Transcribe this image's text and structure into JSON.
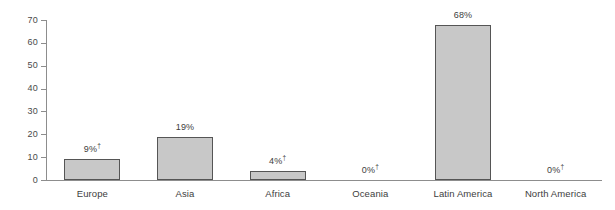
{
  "chart_data": {
    "type": "bar",
    "title": "",
    "subtitle": "",
    "xlabel": "",
    "ylabel": "",
    "ylim": [
      0,
      70
    ],
    "ytick_labels": [
      "70",
      "60",
      "50",
      "40",
      "30",
      "20",
      "10",
      "0"
    ],
    "ytick_values": [
      70,
      60,
      50,
      40,
      30,
      20,
      10,
      0
    ],
    "grid": false,
    "legend": null,
    "categories": [
      "Europe",
      "Asia",
      "Africa",
      "Oceania",
      "Latin America",
      "North America"
    ],
    "values": [
      9,
      19,
      4,
      0,
      68,
      0
    ],
    "data_labels": [
      "9%",
      "19%",
      "4%",
      "0%",
      "68%",
      "0%"
    ],
    "footnote_markers": [
      "†",
      "",
      "†",
      "†",
      "",
      "†"
    ],
    "colors": {
      "bar_fill": "#c8c8c8",
      "bar_border": "#555555",
      "axis": "#8d8d8d",
      "text": "#3d3d3d",
      "background": "#ffffff"
    }
  }
}
